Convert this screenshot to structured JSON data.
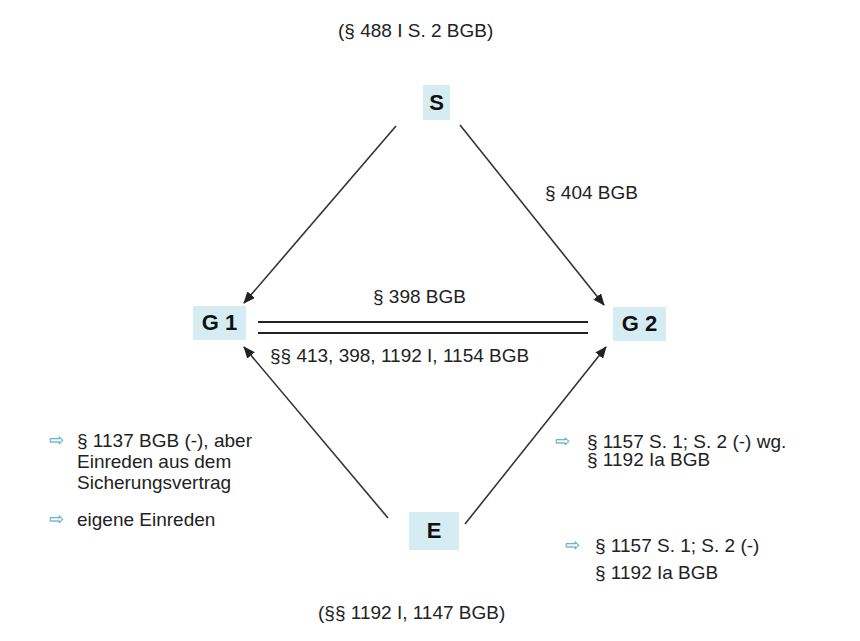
{
  "colors": {
    "node_fill": "#d6ecf3",
    "edge": "#222222",
    "bullet_arrow": "#4aa8c8",
    "text": "#222222"
  },
  "top_caption": "(§ 488 I S. 2 BGB)",
  "bottom_caption": "(§§ 1192 I, 1147 BGB)",
  "nodes": {
    "S": "S",
    "G1": "G 1",
    "G2": "G 2",
    "E": "E"
  },
  "edges": {
    "s_to_g2": "§ 404 BGB",
    "g1_g2_top": "§ 398 BGB",
    "g1_g2_bottom": "§§ 413, 398, 1192 I, 1154 BGB"
  },
  "notes_left": [
    {
      "icon": "right-arrow-outline-icon",
      "glyph": "⇨",
      "lines": [
        "§ 1137 BGB (-), aber",
        "Einreden aus dem",
        "Sicherungsvertrag"
      ]
    },
    {
      "icon": "right-arrow-outline-icon",
      "glyph": "⇨",
      "lines": [
        "eigene Einreden"
      ]
    }
  ],
  "notes_right": [
    {
      "icon": "right-arrow-outline-icon",
      "glyph": "⇨",
      "lines": [
        "§ 1157 S. 1; S. 2 (-) wg.",
        "§ 1192 Ia  BGB"
      ]
    },
    {
      "icon": "right-arrow-outline-icon",
      "glyph": "⇨",
      "lines": [
        "§ 1157 S. 1; S. 2 (-)",
        "§ 1192 Ia BGB"
      ]
    }
  ]
}
